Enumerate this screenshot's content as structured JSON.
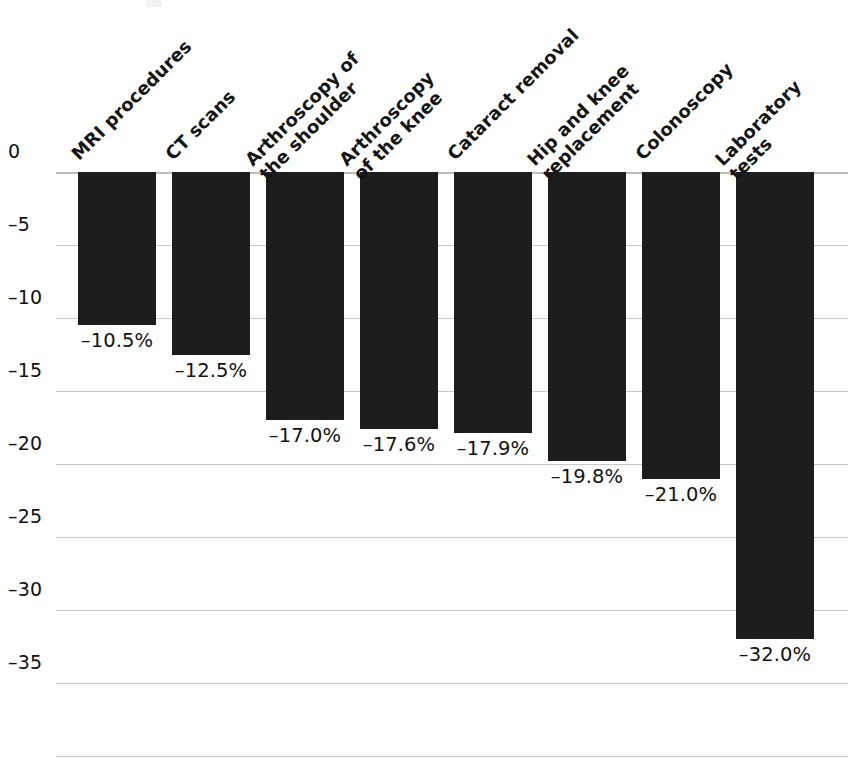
{
  "chart_data": {
    "type": "bar",
    "title": "",
    "subtitle": "",
    "xlabel": "",
    "ylabel": "",
    "orientation": "vertical",
    "grid": true,
    "legend": "none",
    "ylim": [
      -37.5,
      0
    ],
    "yticks": [
      "0",
      "–5",
      "–10",
      "–15",
      "–20",
      "–25",
      "–30",
      "–35"
    ],
    "ytick_values": [
      0,
      -5,
      -10,
      -15,
      -20,
      -25,
      -30,
      -35
    ],
    "categories": [
      "MRI procedures",
      "CT scans",
      "Arthroscopy of the shoulder",
      "Arthroscopy of the knee",
      "Cataract removal",
      "Hip and knee replacement",
      "Colonoscopy",
      "Laboratory tests"
    ],
    "category_lines": [
      [
        "MRI procedures"
      ],
      [
        "CT scans"
      ],
      [
        "Arthroscopy of",
        "the shoulder"
      ],
      [
        "Arthroscopy",
        "of the knee"
      ],
      [
        "Cataract removal"
      ],
      [
        "Hip and knee",
        "replacement"
      ],
      [
        "Colonoscopy"
      ],
      [
        "Laboratory",
        "tests"
      ]
    ],
    "values": [
      -10.5,
      -12.5,
      -17.0,
      -17.6,
      -17.9,
      -19.8,
      -21.0,
      -32.0
    ],
    "value_labels": [
      "–10.5%",
      "–12.5%",
      "–17.0%",
      "–17.6%",
      "–17.9%",
      "–19.8%",
      "–21.0%",
      "–32.0%"
    ],
    "bar_color": "#1d1d1d",
    "gridline_color": "#c9c9c9",
    "background_color": "#ffffff"
  }
}
